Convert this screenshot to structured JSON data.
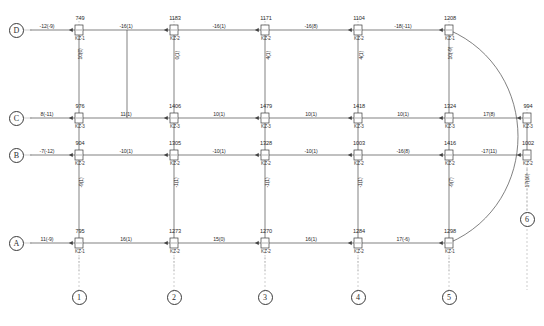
{
  "drawing": {
    "type": "structural-frame-internal-force-diagram",
    "width": 544,
    "height": 326,
    "line_color": "#4a4a4a",
    "text_color": "#2b2b2b",
    "background": "#ffffff"
  },
  "grid": {
    "columns": [
      {
        "id": "1",
        "label": "1",
        "x": 79
      },
      {
        "id": "2",
        "label": "2",
        "x": 174
      },
      {
        "id": "3",
        "label": "3",
        "x": 265
      },
      {
        "id": "4",
        "label": "4",
        "x": 358
      },
      {
        "id": "5",
        "label": "5",
        "x": 449
      },
      {
        "id": "6",
        "label": "6",
        "x": 527
      }
    ],
    "rows": [
      {
        "id": "D",
        "label": "D",
        "y": 30
      },
      {
        "id": "C",
        "label": "C",
        "y": 118
      },
      {
        "id": "B",
        "label": "B",
        "y": 155
      },
      {
        "id": "A",
        "label": "A",
        "y": 243
      }
    ]
  },
  "joints": [
    {
      "row": "D",
      "col": "1",
      "axial": "749",
      "tag": "KZ-1",
      "x": 79,
      "y": 30
    },
    {
      "row": "D",
      "col": "2",
      "axial": "1183",
      "tag": "KZ-2",
      "x": 174,
      "y": 30
    },
    {
      "row": "D",
      "col": "3",
      "axial": "1171",
      "tag": "KZ-2",
      "x": 265,
      "y": 30
    },
    {
      "row": "D",
      "col": "4",
      "axial": "1104",
      "tag": "KZ-2",
      "x": 358,
      "y": 30
    },
    {
      "row": "D",
      "col": "5",
      "axial": "1208",
      "tag": "KZ-1",
      "x": 449,
      "y": 30
    },
    {
      "row": "C",
      "col": "1",
      "axial": "976",
      "tag": "KZ-3",
      "x": 79,
      "y": 118
    },
    {
      "row": "C",
      "col": "2",
      "axial": "1406",
      "tag": "KZ-3",
      "x": 174,
      "y": 118
    },
    {
      "row": "C",
      "col": "3",
      "axial": "1479",
      "tag": "KZ-3",
      "x": 265,
      "y": 118
    },
    {
      "row": "C",
      "col": "4",
      "axial": "1418",
      "tag": "KZ-3",
      "x": 358,
      "y": 118
    },
    {
      "row": "C",
      "col": "5",
      "axial": "1324",
      "tag": "KZ-3",
      "x": 449,
      "y": 118
    },
    {
      "row": "C",
      "col": "6",
      "axial": "994",
      "tag": "KZ-3",
      "x": 527,
      "y": 118
    },
    {
      "row": "B",
      "col": "1",
      "axial": "904",
      "tag": "KZ-2",
      "x": 79,
      "y": 155
    },
    {
      "row": "B",
      "col": "2",
      "axial": "1305",
      "tag": "KZ-2",
      "x": 174,
      "y": 155
    },
    {
      "row": "B",
      "col": "3",
      "axial": "1328",
      "tag": "KZ-2",
      "x": 265,
      "y": 155
    },
    {
      "row": "B",
      "col": "4",
      "axial": "1003",
      "tag": "KZ-2",
      "x": 358,
      "y": 155
    },
    {
      "row": "B",
      "col": "5",
      "axial": "1416",
      "tag": "KZ-2",
      "x": 449,
      "y": 155
    },
    {
      "row": "B",
      "col": "6",
      "axial": "1002",
      "tag": "KZ-2",
      "x": 527,
      "y": 155
    },
    {
      "row": "A",
      "col": "1",
      "axial": "795",
      "tag": "KZ-1",
      "x": 79,
      "y": 243
    },
    {
      "row": "A",
      "col": "2",
      "axial": "1273",
      "tag": "KZ-2",
      "x": 174,
      "y": 243
    },
    {
      "row": "A",
      "col": "3",
      "axial": "1270",
      "tag": "KZ-2",
      "x": 265,
      "y": 243
    },
    {
      "row": "A",
      "col": "4",
      "axial": "1284",
      "tag": "KZ-2",
      "x": 358,
      "y": 243
    },
    {
      "row": "A",
      "col": "5",
      "axial": "1298",
      "tag": "KZ-1",
      "x": 449,
      "y": 243
    }
  ],
  "horizontal_span_values": [
    {
      "row": "D",
      "text": "-12(-9)",
      "x": 47,
      "y": 30
    },
    {
      "row": "D",
      "text": "-16(1)",
      "x": 126,
      "y": 30
    },
    {
      "row": "D",
      "text": "-16(1)",
      "x": 219,
      "y": 30
    },
    {
      "row": "D",
      "text": "-16(8)",
      "x": 311,
      "y": 30
    },
    {
      "row": "D",
      "text": "-18(-11)",
      "x": 403,
      "y": 30
    },
    {
      "row": "C",
      "text": "8(-11)",
      "x": 47,
      "y": 118
    },
    {
      "row": "C",
      "text": "11(1)",
      "x": 126,
      "y": 118
    },
    {
      "row": "C",
      "text": "10(1)",
      "x": 219,
      "y": 118
    },
    {
      "row": "C",
      "text": "10(1)",
      "x": 311,
      "y": 118
    },
    {
      "row": "C",
      "text": "10(1)",
      "x": 403,
      "y": 118
    },
    {
      "row": "C",
      "text": "17(8)",
      "x": 489,
      "y": 118
    },
    {
      "row": "B",
      "text": "-7(-12)",
      "x": 47,
      "y": 155
    },
    {
      "row": "B",
      "text": "-10(1)",
      "x": 126,
      "y": 155
    },
    {
      "row": "B",
      "text": "-10(1)",
      "x": 219,
      "y": 155
    },
    {
      "row": "B",
      "text": "-10(1)",
      "x": 311,
      "y": 155
    },
    {
      "row": "B",
      "text": "-16(8)",
      "x": 403,
      "y": 155
    },
    {
      "row": "B",
      "text": "-17(11)",
      "x": 489,
      "y": 155
    },
    {
      "row": "A",
      "text": "11(-9)",
      "x": 47,
      "y": 243
    },
    {
      "row": "A",
      "text": "16(1)",
      "x": 126,
      "y": 243
    },
    {
      "row": "A",
      "text": "15(0)",
      "x": 219,
      "y": 243
    },
    {
      "row": "A",
      "text": "16(1)",
      "x": 311,
      "y": 243
    },
    {
      "row": "A",
      "text": "17(-6)",
      "x": 403,
      "y": 243
    }
  ],
  "vertical_span_values": [
    {
      "col": "1",
      "bay": "D-C",
      "text": "10(0)",
      "x": 79,
      "y": 62
    },
    {
      "col": "2",
      "bay": "D-C",
      "text": "0(1)",
      "x": 174,
      "y": 62
    },
    {
      "col": "3",
      "bay": "D-C",
      "text": "4(1)",
      "x": 265,
      "y": 62
    },
    {
      "col": "4",
      "bay": "D-C",
      "text": "4(1)",
      "x": 358,
      "y": 62
    },
    {
      "col": "5",
      "bay": "D-C",
      "text": "10(-9)",
      "x": 449,
      "y": 62
    },
    {
      "col": "1",
      "bay": "B-A",
      "text": "-9(1)",
      "x": 79,
      "y": 190
    },
    {
      "col": "2",
      "bay": "B-A",
      "text": "-1(1)",
      "x": 174,
      "y": 190
    },
    {
      "col": "3",
      "bay": "B-A",
      "text": "-1(1)",
      "x": 265,
      "y": 190
    },
    {
      "col": "4",
      "bay": "B-A",
      "text": "-1(1)",
      "x": 358,
      "y": 190
    },
    {
      "col": "5",
      "bay": "B-A",
      "text": "-9(7)",
      "x": 449,
      "y": 190
    },
    {
      "col": "6",
      "bay": "B-6",
      "text": "17(10)",
      "x": 527,
      "y": 190
    }
  ],
  "arc": {
    "name": "curved-beam",
    "start_x": 449,
    "start_y": 30,
    "end_x": 449,
    "end_y": 243,
    "peak_x": 541
  }
}
